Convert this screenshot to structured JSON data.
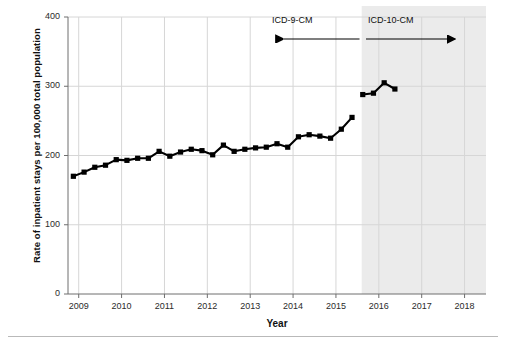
{
  "chart_data": {
    "type": "line",
    "title": "",
    "xlabel": "Year",
    "ylabel": "Rate of inpatient stays per 100,000 total population",
    "ylim": [
      0,
      400
    ],
    "yticks": [
      0,
      100,
      200,
      300,
      400
    ],
    "ytick_labels": [
      "0",
      "100",
      "200",
      "300",
      "400"
    ],
    "xlim": [
      2008.75,
      2018.5
    ],
    "xticks": [
      2009,
      2010,
      2011,
      2012,
      2013,
      2014,
      2015,
      2016,
      2017,
      2018
    ],
    "xtick_labels": [
      "2009",
      "2010",
      "2011",
      "2012",
      "2013",
      "2014",
      "2015",
      "2016",
      "2017",
      "2018"
    ],
    "grid": true,
    "legend": "none",
    "marker": "square",
    "line_color": "#000000",
    "marker_color": "#000000",
    "shaded_region_color": "#ebebeb",
    "shaded_region_start": 2015.6,
    "shaded_region_end": 2018.5,
    "series": [
      {
        "name": "ICD-9-CM",
        "x": [
          2008.875,
          2009.125,
          2009.375,
          2009.625,
          2009.875,
          2010.125,
          2010.375,
          2010.625,
          2010.875,
          2011.125,
          2011.375,
          2011.625,
          2011.875,
          2012.125,
          2012.375,
          2012.625,
          2012.875,
          2013.125,
          2013.375,
          2013.625,
          2013.875,
          2014.125,
          2014.375,
          2014.625,
          2014.875,
          2015.125,
          2015.375
        ],
        "values": [
          170,
          176,
          183,
          186,
          194,
          193,
          196,
          196,
          206,
          199,
          205,
          209,
          207,
          201,
          215,
          206,
          209,
          211,
          212,
          217,
          212,
          227,
          230,
          228,
          225,
          238,
          255
        ]
      },
      {
        "name": "ICD-10-CM",
        "x": [
          2015.625,
          2015.875,
          2016.125,
          2016.375
        ],
        "values": [
          288,
          290,
          305,
          296
        ]
      }
    ],
    "annotations": [
      {
        "text": "ICD-9-CM",
        "arrow": "left",
        "x_start": 2015.55,
        "x_end": 2013.6
      },
      {
        "text": "ICD-10-CM",
        "arrow": "right",
        "x_start": 2015.7,
        "x_end": 2017.6
      }
    ]
  },
  "axis": {
    "y_title": "Rate of inpatient stays per 100,000 total population",
    "x_title": "Year"
  },
  "eras": {
    "icd9_label": "ICD-9-CM",
    "icd10_label": "ICD-10-CM"
  }
}
